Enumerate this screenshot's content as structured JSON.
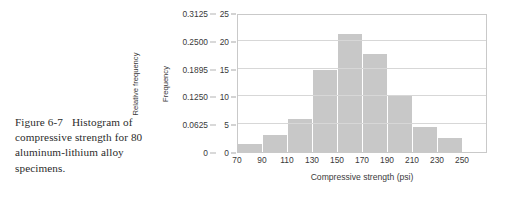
{
  "caption": {
    "figure_number": "Figure 6-7",
    "text": "Histogram of compressive strength for 80 aluminum-lithium alloy specimens."
  },
  "colors": {
    "bar_fill": "#c8c8c8",
    "gridline": "#d7d7d7",
    "frame": "#c9c9c9",
    "text": "#3a3a3a",
    "caption_text": "#2b2b2b"
  },
  "chart_data": {
    "type": "bar",
    "title": "",
    "xlabel": "Compressive strength (psi)",
    "ylabel": "Frequency",
    "y2label": "Relative frequency",
    "grid": true,
    "legend": "none",
    "xlim": [
      70,
      270
    ],
    "ylim": [
      0,
      25
    ],
    "y2lim": [
      0,
      0.3125
    ],
    "xticks": [
      "70",
      "90",
      "110",
      "130",
      "150",
      "170",
      "190",
      "210",
      "230",
      "250"
    ],
    "xtick_values": [
      70,
      90,
      110,
      130,
      150,
      170,
      190,
      210,
      230,
      250
    ],
    "yticks": [
      "0",
      "5",
      "10",
      "15",
      "20",
      "25"
    ],
    "ytick_values": [
      0,
      5,
      10,
      15,
      20,
      25
    ],
    "y2ticks": [
      "0",
      "0.0625",
      "0.1250",
      "0.1895",
      "0.2500",
      "0.3125"
    ],
    "y2tick_values": [
      0,
      0.0625,
      0.125,
      0.1895,
      0.25,
      0.3125
    ],
    "bin_edges": [
      70,
      90,
      110,
      130,
      150,
      170,
      190,
      210,
      230,
      250
    ],
    "categories": [
      "70-90",
      "90-110",
      "110-130",
      "130-150",
      "150-170",
      "170-190",
      "190-210",
      "210-230",
      "230-250"
    ],
    "values": [
      1.5,
      3,
      6,
      14.8,
      21.3,
      17.6,
      10.1,
      4.5,
      2.5
    ],
    "total_observations": 80
  }
}
